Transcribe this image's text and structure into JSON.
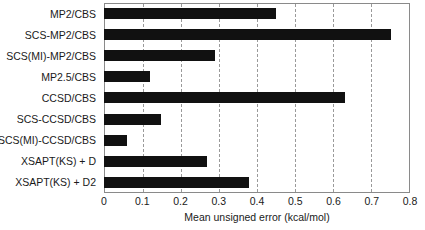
{
  "chart_data": {
    "type": "bar",
    "orientation": "horizontal",
    "title": "",
    "xlabel": "Mean unsigned error (kcal/mol)",
    "ylabel": "",
    "xlim": [
      0,
      0.8
    ],
    "xticks": [
      "0",
      "0.1",
      "0.2",
      "0.3",
      "0.4",
      "0.5",
      "0.6",
      "0.7",
      "0.8"
    ],
    "xtick_values": [
      0,
      0.1,
      0.2,
      0.3,
      0.4,
      0.5,
      0.6,
      0.7,
      0.8
    ],
    "grid": "vertical dashed gridlines at each x tick",
    "legend": "none",
    "bar_color": "#111111",
    "categories": [
      "MP2/CBS",
      "SCS-MP2/CBS",
      "SCS(MI)-MP2/CBS",
      "MP2.5/CBS",
      "CCSD/CBS",
      "SCS-CCSD/CBS",
      "SCS(MI)-CCSD/CBS",
      "XSAPT(KS) + D",
      "XSAPT(KS) + D2"
    ],
    "values": [
      0.45,
      0.75,
      0.29,
      0.12,
      0.63,
      0.15,
      0.06,
      0.27,
      0.38
    ]
  }
}
